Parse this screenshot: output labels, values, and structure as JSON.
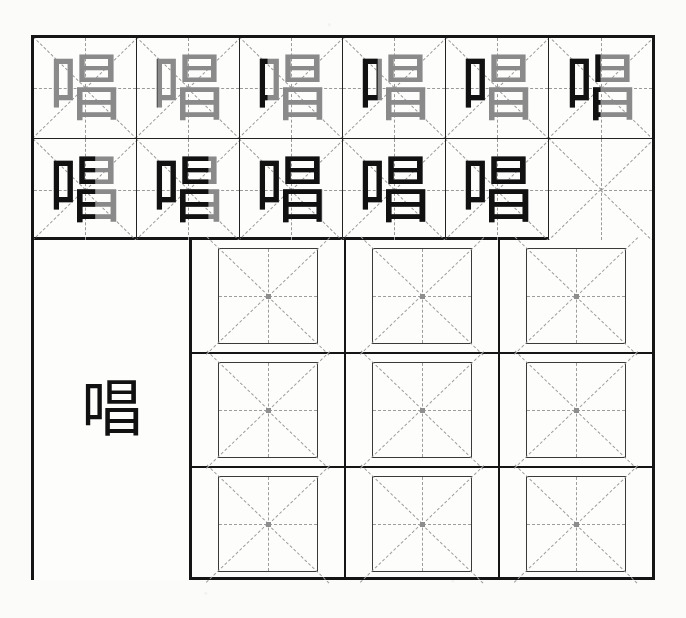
{
  "worksheet": {
    "character": "唱",
    "pinyin": "chàng",
    "meaning": "to sing",
    "stroke_count": 11,
    "title": "Chinese character handwriting practice worksheet",
    "grid_style": "mizige",
    "ink_color": "#111111",
    "ghost_color": "#8a8a8a",
    "guide_color": "#9a9a9a",
    "border_color": "#151515",
    "paper_color": "#fdfdfc"
  },
  "stroke_demo": {
    "rows": [
      {
        "row_index": 1,
        "cells": [
          {
            "label": "唱",
            "strokes_shown": 1,
            "state": "partial",
            "reveal_pct": 12
          },
          {
            "label": "唱",
            "strokes_shown": 2,
            "state": "partial",
            "reveal_pct": 20
          },
          {
            "label": "唱",
            "strokes_shown": 3,
            "state": "partial",
            "reveal_pct": 27
          },
          {
            "label": "唱",
            "strokes_shown": 4,
            "state": "partial",
            "reveal_pct": 34
          },
          {
            "label": "唱",
            "strokes_shown": 5,
            "state": "partial",
            "reveal_pct": 42
          },
          {
            "label": "唱",
            "strokes_shown": 6,
            "state": "partial",
            "reveal_pct": 50
          }
        ]
      },
      {
        "row_index": 2,
        "cells": [
          {
            "label": "唱",
            "strokes_shown": 7,
            "state": "partial",
            "reveal_pct": 60
          },
          {
            "label": "唱",
            "strokes_shown": 8,
            "state": "partial",
            "reveal_pct": 70
          },
          {
            "label": "唱",
            "strokes_shown": 9,
            "state": "partial",
            "reveal_pct": 80
          },
          {
            "label": "唱",
            "strokes_shown": 10,
            "state": "partial",
            "reveal_pct": 91
          },
          {
            "label": "唱",
            "strokes_shown": 11,
            "state": "complete",
            "reveal_pct": 100
          },
          {
            "label": "",
            "strokes_shown": 0,
            "state": "blank",
            "reveal_pct": 0
          }
        ]
      }
    ]
  },
  "model_panel": {
    "character": "唱"
  },
  "practice_grid": {
    "rows": 3,
    "columns": 3,
    "cells": [
      {
        "row": 1,
        "col": 1,
        "content": "",
        "state": "empty"
      },
      {
        "row": 1,
        "col": 2,
        "content": "",
        "state": "empty"
      },
      {
        "row": 1,
        "col": 3,
        "content": "",
        "state": "empty"
      },
      {
        "row": 2,
        "col": 1,
        "content": "",
        "state": "empty"
      },
      {
        "row": 2,
        "col": 2,
        "content": "",
        "state": "empty"
      },
      {
        "row": 2,
        "col": 3,
        "content": "",
        "state": "empty"
      },
      {
        "row": 3,
        "col": 1,
        "content": "",
        "state": "empty"
      },
      {
        "row": 3,
        "col": 2,
        "content": "",
        "state": "empty"
      },
      {
        "row": 3,
        "col": 3,
        "content": "",
        "state": "empty"
      }
    ]
  }
}
